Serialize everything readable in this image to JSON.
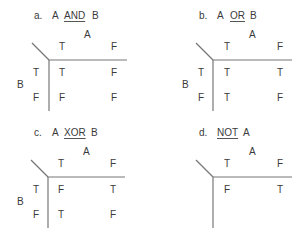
{
  "panels": [
    {
      "letter": "a.",
      "title_pre": "A",
      "operator": "AND",
      "title_post": "B",
      "col_var": "A",
      "col_headers": [
        "T",
        "F"
      ],
      "row_var": "B",
      "row_headers": [
        "T",
        "F"
      ],
      "cells": [
        [
          "T",
          "F"
        ],
        [
          "F",
          "F"
        ]
      ]
    },
    {
      "letter": "b.",
      "title_pre": "A",
      "operator": "OR",
      "title_post": "B",
      "col_var": "A",
      "col_headers": [
        "T",
        "F"
      ],
      "row_var": "B",
      "row_headers": [
        "T",
        "F"
      ],
      "cells": [
        [
          "T",
          "T"
        ],
        [
          "T",
          "F"
        ]
      ]
    },
    {
      "letter": "c.",
      "title_pre": "A",
      "operator": "XOR",
      "title_post": "B",
      "col_var": "A",
      "col_headers": [
        "T",
        "F"
      ],
      "row_var": "B",
      "row_headers": [
        "T",
        "F"
      ],
      "cells": [
        [
          "F",
          "T"
        ],
        [
          "T",
          "F"
        ]
      ]
    },
    {
      "letter": "d.",
      "title_pre": "",
      "operator": "NOT",
      "title_post": "A",
      "col_var": "A",
      "col_headers": [
        "T",
        "F"
      ],
      "cells": [
        [
          "F",
          "T"
        ]
      ]
    }
  ]
}
